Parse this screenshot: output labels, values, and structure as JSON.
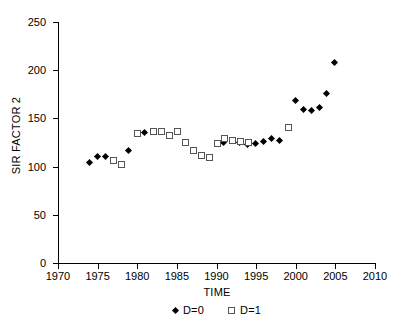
{
  "chart_data": {
    "type": "scatter",
    "title": "",
    "xlabel": "TIME",
    "ylabel": "SIR FACTOR 2",
    "xlim": [
      1970,
      2010
    ],
    "ylim": [
      0,
      250
    ],
    "xticks": [
      1970,
      1975,
      1980,
      1985,
      1990,
      1995,
      2000,
      2005,
      2010
    ],
    "yticks": [
      0,
      50,
      100,
      150,
      200,
      250
    ],
    "grid": false,
    "legend_position": "bottom-center",
    "series": [
      {
        "name": "D=0",
        "marker": "filled-diamond",
        "color": "#000000",
        "points": [
          {
            "x": 1974,
            "y": 104
          },
          {
            "x": 1975,
            "y": 110
          },
          {
            "x": 1976,
            "y": 110
          },
          {
            "x": 1979,
            "y": 116
          },
          {
            "x": 1981,
            "y": 135
          },
          {
            "x": 1991,
            "y": 125
          },
          {
            "x": 1993,
            "y": 124
          },
          {
            "x": 1994,
            "y": 122
          },
          {
            "x": 1995,
            "y": 123
          },
          {
            "x": 1996,
            "y": 126
          },
          {
            "x": 1997,
            "y": 129
          },
          {
            "x": 1998,
            "y": 127
          },
          {
            "x": 2000,
            "y": 168
          },
          {
            "x": 2001,
            "y": 159
          },
          {
            "x": 2002,
            "y": 158
          },
          {
            "x": 2003,
            "y": 161
          },
          {
            "x": 2004,
            "y": 175
          },
          {
            "x": 2005,
            "y": 207
          }
        ]
      },
      {
        "name": "D=1",
        "marker": "open-square",
        "color": "#555555",
        "points": [
          {
            "x": 1977,
            "y": 107
          },
          {
            "x": 1978,
            "y": 103
          },
          {
            "x": 1980,
            "y": 135
          },
          {
            "x": 1982,
            "y": 137
          },
          {
            "x": 1983,
            "y": 137
          },
          {
            "x": 1984,
            "y": 133
          },
          {
            "x": 1985,
            "y": 137
          },
          {
            "x": 1986,
            "y": 126
          },
          {
            "x": 1987,
            "y": 117
          },
          {
            "x": 1988,
            "y": 112
          },
          {
            "x": 1989,
            "y": 110
          },
          {
            "x": 1990,
            "y": 124
          },
          {
            "x": 1991,
            "y": 130
          },
          {
            "x": 1992,
            "y": 128
          },
          {
            "x": 1993,
            "y": 127
          },
          {
            "x": 1994,
            "y": 126
          },
          {
            "x": 1999,
            "y": 141
          }
        ]
      }
    ]
  },
  "legend": {
    "entries": [
      {
        "label": "D=0"
      },
      {
        "label": "D=1"
      }
    ]
  }
}
